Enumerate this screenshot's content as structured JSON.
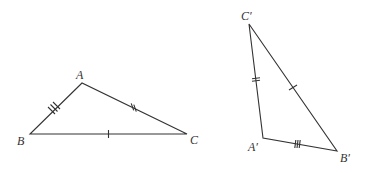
{
  "diagram": {
    "stroke_color": "#333333",
    "triangle_1": {
      "vertices": {
        "A": {
          "label": "A",
          "x": 82,
          "y": 83
        },
        "B": {
          "label": "B",
          "x": 30,
          "y": 134
        },
        "C": {
          "label": "C",
          "x": 187,
          "y": 134
        }
      },
      "tick_marks": {
        "AB": 3,
        "AC": 2,
        "BC": 1
      }
    },
    "triangle_2": {
      "vertices": {
        "A": {
          "label": "A′",
          "x": 263,
          "y": 138
        },
        "B": {
          "label": "B′",
          "x": 337,
          "y": 151
        },
        "C": {
          "label": "C′",
          "x": 249,
          "y": 24
        }
      },
      "tick_marks": {
        "A'B'": 3,
        "A'C'": 2,
        "B'C'": 1
      }
    }
  }
}
